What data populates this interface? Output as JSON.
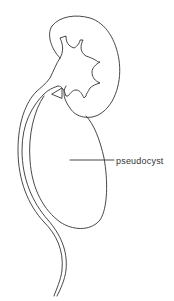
{
  "diagram": {
    "type": "anatomical line drawing",
    "structures": [
      "kidney",
      "renal pelvis with calyces",
      "ureter",
      "pseudocyst"
    ],
    "labels": [
      {
        "text": "pseudocyst",
        "target": "pseudocyst"
      }
    ],
    "colors": {
      "stroke": "#333333",
      "background": "#ffffff"
    }
  }
}
